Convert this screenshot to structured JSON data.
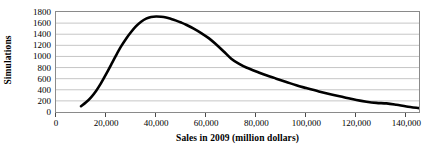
{
  "chart_data": {
    "type": "line",
    "title": "",
    "xlabel": "Sales in 2009 (million dollars)",
    "ylabel": "Simulations",
    "xlim": [
      0,
      145000
    ],
    "ylim": [
      0,
      1800
    ],
    "grid": true,
    "legend": false,
    "x_tick_labels": [
      "0",
      "20,000",
      "40,000",
      "60,000",
      "80,000",
      "100,000",
      "120,000",
      "140,000"
    ],
    "x_tick_values": [
      0,
      20000,
      40000,
      60000,
      80000,
      100000,
      120000,
      140000
    ],
    "y_tick_labels": [
      "0",
      "200",
      "400",
      "600",
      "800",
      "1000",
      "1200",
      "1400",
      "1600",
      "1800"
    ],
    "y_tick_values": [
      0,
      200,
      400,
      600,
      800,
      1000,
      1200,
      1400,
      1600,
      1800
    ],
    "series": [
      {
        "name": "Simulations",
        "color": "#000000",
        "x": [
          10000,
          12000,
          14000,
          16000,
          18000,
          20000,
          22000,
          24000,
          26000,
          28000,
          30000,
          32000,
          34000,
          36000,
          38000,
          40000,
          42000,
          44000,
          46000,
          48000,
          50000,
          52000,
          55000,
          58000,
          61000,
          64000,
          67000,
          70000,
          73000,
          76000,
          80000,
          84000,
          88000,
          92000,
          96000,
          100000,
          105000,
          110000,
          115000,
          120000,
          124000,
          128000,
          132000,
          136000,
          140000,
          145000
        ],
        "values": [
          105,
          175,
          265,
          380,
          520,
          680,
          850,
          1020,
          1180,
          1320,
          1440,
          1545,
          1625,
          1680,
          1710,
          1720,
          1715,
          1700,
          1675,
          1645,
          1610,
          1570,
          1500,
          1420,
          1330,
          1215,
          1090,
          960,
          870,
          800,
          730,
          660,
          600,
          540,
          480,
          430,
          370,
          315,
          265,
          215,
          185,
          165,
          155,
          130,
          100,
          70
        ]
      }
    ]
  }
}
